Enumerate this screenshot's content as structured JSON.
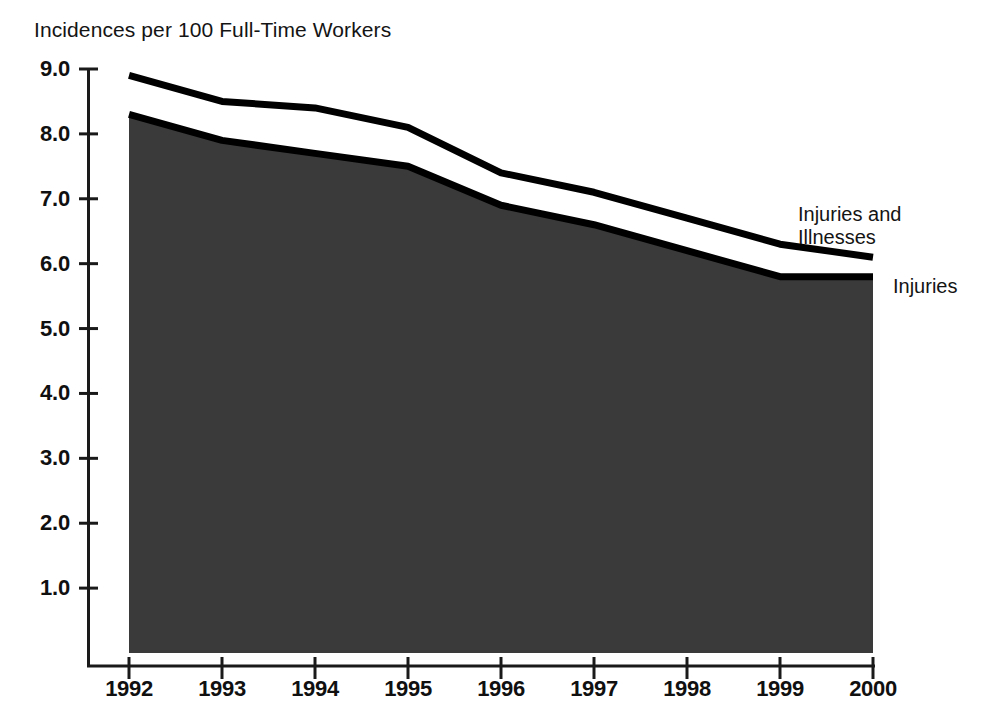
{
  "chart_data": {
    "type": "area",
    "title": "Incidences per 100 Full-Time Workers",
    "xlabel": "",
    "ylabel": "",
    "categories": [
      "1992",
      "1993",
      "1994",
      "1995",
      "1996",
      "1997",
      "1998",
      "1999",
      "2000"
    ],
    "x": [
      1992,
      1993,
      1994,
      1995,
      1996,
      1997,
      1998,
      1999,
      2000
    ],
    "ylim": [
      0,
      9.0
    ],
    "xlim": [
      1992,
      2000
    ],
    "grid": false,
    "legend_position": "right-inline",
    "ytick_labels": [
      "9.0",
      "8.0",
      "7.0",
      "6.0",
      "5.0",
      "4.0",
      "3.0",
      "2.0",
      "1.0"
    ],
    "ytick_values": [
      9.0,
      8.0,
      7.0,
      6.0,
      5.0,
      4.0,
      3.0,
      2.0,
      1.0
    ],
    "series": [
      {
        "name": "Injuries and Illnesses",
        "values": [
          8.9,
          8.5,
          8.4,
          8.1,
          7.4,
          7.1,
          6.7,
          6.3,
          6.1
        ],
        "line_color": "#000000",
        "fill_color": "#ffffff"
      },
      {
        "name": "Injuries",
        "values": [
          8.3,
          7.9,
          7.7,
          7.5,
          6.9,
          6.6,
          6.2,
          5.8,
          5.8
        ],
        "line_color": "#000000",
        "fill_color": "#3a3a3a"
      }
    ],
    "colors": {
      "axis": "#1a1a1a",
      "text": "#101010",
      "fill_dark": "#3a3a3a",
      "background": "#ffffff"
    }
  },
  "labels": {
    "series_upper": "Injuries and\nIllnesses",
    "series_lower": "Injuries"
  }
}
